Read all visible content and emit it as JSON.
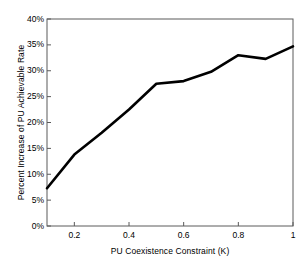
{
  "chart_data": {
    "type": "line",
    "title": "",
    "xlabel": "PU Coexistence Constraint (K)",
    "ylabel": "Percent Increase of PU Achievable Rate",
    "x": [
      0.1,
      0.2,
      0.3,
      0.4,
      0.5,
      0.6,
      0.7,
      0.8,
      0.9,
      1.0
    ],
    "values": [
      7.3,
      13.8,
      18.0,
      22.5,
      27.5,
      28.0,
      29.8,
      33.0,
      32.3,
      34.7
    ],
    "series": [
      {
        "name": "Percent Increase of PU Achievable Rate",
        "values": [
          7.3,
          13.8,
          18.0,
          22.5,
          27.5,
          28.0,
          29.8,
          33.0,
          32.3,
          34.7
        ],
        "color": "#000000"
      }
    ],
    "xlim": [
      0.1,
      1.0
    ],
    "ylim": [
      0,
      40
    ],
    "xticks": [
      0.2,
      0.4,
      0.6,
      0.8,
      1
    ],
    "xtick_labels": [
      "0.2",
      "0.4",
      "0.6",
      "0.8",
      "1"
    ],
    "yticks": [
      0,
      5,
      10,
      15,
      20,
      25,
      30,
      35,
      40
    ],
    "ytick_labels": [
      "0%",
      "5%",
      "10%",
      "15%",
      "20%",
      "25%",
      "30%",
      "35%",
      "40%"
    ],
    "grid": false,
    "legend": null,
    "line_color": "#000000",
    "axis_color": "#000000",
    "background_color": "#ffffff"
  }
}
